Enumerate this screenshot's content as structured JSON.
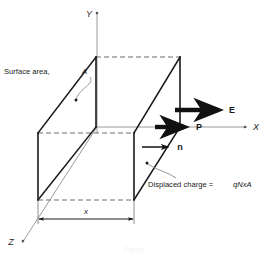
{
  "figure": {
    "kind": "3d-box-polarization-diagram",
    "background_color": "#ffffff",
    "line_color": "#1a1a1a",
    "axis_color": "#9a9a9a",
    "dashed_color": "#6f6f6f",
    "leader_color": "#8a8a8a"
  },
  "axes": {
    "y_label": "Y",
    "x_label": "X",
    "z_label": "Z"
  },
  "vectors": [
    {
      "name": "electric-field",
      "label": "E"
    },
    {
      "name": "polarization",
      "label": "P"
    },
    {
      "name": "normal",
      "label": "n"
    }
  ],
  "annotations": {
    "surface_area": {
      "text_prefix": "Surface area, ",
      "symbol": "A"
    },
    "displaced_charge": {
      "text_prefix": "Displaced charge = ",
      "formula": "qNxA"
    }
  },
  "dimension": {
    "label": "x"
  },
  "caption": {
    "text": "Figure"
  }
}
